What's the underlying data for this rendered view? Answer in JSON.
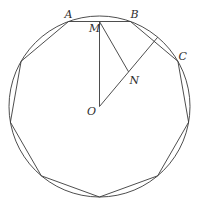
{
  "diagram": {
    "background_color": "#ffffff",
    "stroke_color": "#3a3a3a",
    "circle": {
      "cx": 99.5,
      "cy": 106.5,
      "r": 90.5
    },
    "polygon": {
      "name": "inscribed-nonagon",
      "vertices": [
        [
          68.5,
          21.5
        ],
        [
          130.5,
          21.5
        ],
        [
          177.9,
          61.3
        ],
        [
          188.6,
          122.2
        ],
        [
          157.7,
          175.8
        ],
        [
          99.5,
          197.0
        ],
        [
          41.3,
          175.8
        ],
        [
          10.4,
          122.2
        ],
        [
          21.1,
          61.3
        ]
      ]
    },
    "points": {
      "M": [
        99.5,
        21.5
      ],
      "N": [
        128.6,
        71.9
      ],
      "O": [
        99.5,
        106.5
      ],
      "arc_mid_BC": [
        157.7,
        37.2
      ]
    },
    "segments": [
      {
        "name": "segment-MO",
        "from": [
          99.5,
          21.5
        ],
        "to": [
          99.5,
          106.5
        ]
      },
      {
        "name": "segment-MN",
        "from": [
          99.5,
          21.5
        ],
        "to": [
          128.6,
          71.9
        ]
      },
      {
        "name": "segment-O-arcmidBC",
        "from": [
          99.5,
          106.5
        ],
        "to": [
          157.7,
          37.2
        ]
      }
    ],
    "labels": [
      {
        "text": "A",
        "x": 64.5,
        "y": 17.5
      },
      {
        "text": "B",
        "x": 130.5,
        "y": 17.5
      },
      {
        "text": "C",
        "x": 178.5,
        "y": 59.5
      },
      {
        "text": "M",
        "x": 89.0,
        "y": 31.5
      },
      {
        "text": "N",
        "x": 129.5,
        "y": 83.5
      },
      {
        "text": "O",
        "x": 87.0,
        "y": 115.0
      }
    ]
  }
}
